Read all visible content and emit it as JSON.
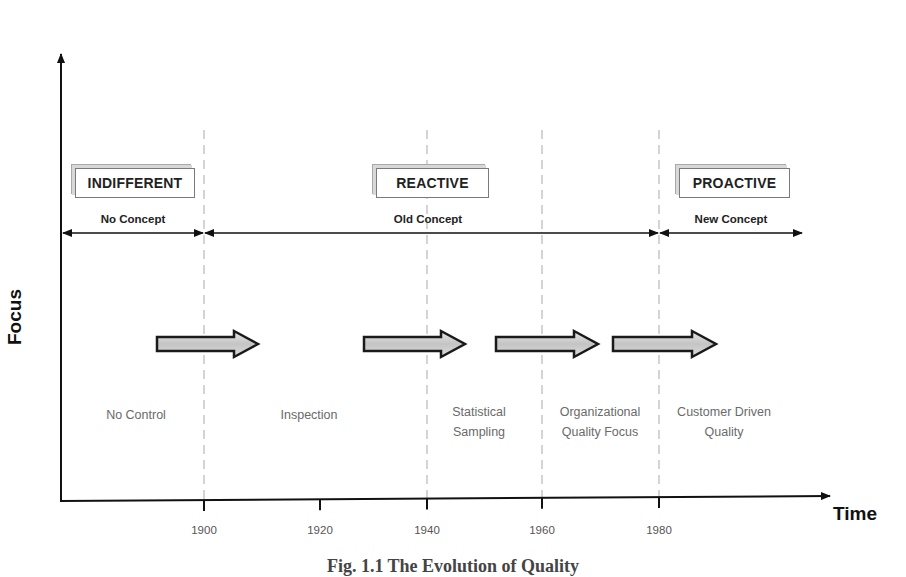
{
  "diagram": {
    "type": "timeline",
    "y_axis": {
      "label": "Focus"
    },
    "x_axis": {
      "label": "Time",
      "ticks": [
        {
          "label": "1900",
          "x": 204
        },
        {
          "label": "1920",
          "x": 320
        },
        {
          "label": "1940",
          "x": 427
        },
        {
          "label": "1960",
          "x": 542
        },
        {
          "label": "1980",
          "x": 659
        }
      ]
    },
    "phases": [
      {
        "label": "INDIFFERENT",
        "concept": "No Concept",
        "left": 75,
        "width": 118
      },
      {
        "label": "REACTIVE",
        "concept": "Old Concept",
        "left": 376,
        "width": 111
      },
      {
        "label": "PROACTIVE",
        "concept": "New Concept",
        "left": 679,
        "width": 109
      }
    ],
    "concept_spans": [
      {
        "label": "No Concept",
        "from": 62,
        "to": 204
      },
      {
        "label": "Old Concept",
        "from": 204,
        "to": 659
      },
      {
        "label": "New Concept",
        "from": 659,
        "to": 803
      }
    ],
    "stages": [
      {
        "lines": [
          "No Control"
        ],
        "x": 136
      },
      {
        "lines": [
          "Inspection"
        ],
        "x": 309
      },
      {
        "lines": [
          "Statistical",
          "Sampling"
        ],
        "x": 479
      },
      {
        "lines": [
          "Organizational",
          "Quality Focus"
        ],
        "x": 600
      },
      {
        "lines": [
          "Customer Driven",
          "Quality"
        ],
        "x": 724
      }
    ],
    "progress_arrows": [
      {
        "from": 157,
        "to": 258
      },
      {
        "from": 364,
        "to": 465
      },
      {
        "from": 496,
        "to": 598
      },
      {
        "from": 613,
        "to": 716
      }
    ],
    "dividers_x": [
      204,
      427,
      542,
      659
    ],
    "caption": "Fig. 1.1 The Evolution of Quality",
    "colors": {
      "axis": "#111111",
      "divider": "#bdbdbd",
      "arrow_fill": "#cfcfcf",
      "arrow_stroke": "#1a1a1a",
      "stage_text": "#6a6a6a"
    }
  }
}
